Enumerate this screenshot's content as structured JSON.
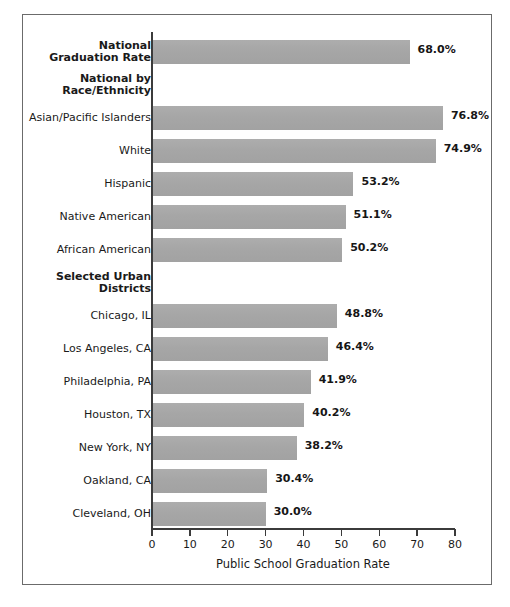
{
  "chart_data": {
    "type": "bar",
    "orientation": "horizontal",
    "title": "",
    "xlabel": "Public School Graduation Rate",
    "ylabel": "",
    "xlim": [
      0,
      80
    ],
    "xticks": [
      0,
      10,
      20,
      30,
      40,
      50,
      60,
      70,
      80
    ],
    "grid": false,
    "legend": null,
    "bar_color": "#a9a9a9",
    "categories": [
      "National\nGraduation Rate",
      "National by\nRace/Ethnicity",
      "Asian/Pacific Islanders",
      "White",
      "Hispanic",
      "Native American",
      "African American",
      "Selected Urban\nDistricts",
      "Chicago, IL",
      "Los Angeles, CA",
      "Philadelphia, PA",
      "Houston, TX",
      "New York, NY",
      "Oakland, CA",
      "Cleveland, OH"
    ],
    "values": [
      68.0,
      null,
      76.8,
      74.9,
      53.2,
      51.1,
      50.2,
      null,
      48.8,
      46.4,
      41.9,
      40.2,
      38.2,
      30.4,
      30.0
    ],
    "value_labels": [
      "68.0%",
      "",
      "76.8%",
      "74.9%",
      "53.2%",
      "51.1%",
      "50.2%",
      "",
      "48.8%",
      "46.4%",
      "41.9%",
      "40.2%",
      "38.2%",
      "30.4%",
      "30.0%"
    ],
    "rows": [
      {
        "label": "National\nGraduation Rate",
        "value": 68.0,
        "value_label": "68.0%",
        "header": true,
        "bar": true
      },
      {
        "label": "National by\nRace/Ethnicity",
        "value": null,
        "value_label": "",
        "header": true,
        "bar": false
      },
      {
        "label": "Asian/Pacific Islanders",
        "value": 76.8,
        "value_label": "76.8%",
        "header": false,
        "bar": true
      },
      {
        "label": "White",
        "value": 74.9,
        "value_label": "74.9%",
        "header": false,
        "bar": true
      },
      {
        "label": "Hispanic",
        "value": 53.2,
        "value_label": "53.2%",
        "header": false,
        "bar": true
      },
      {
        "label": "Native American",
        "value": 51.1,
        "value_label": "51.1%",
        "header": false,
        "bar": true
      },
      {
        "label": "African American",
        "value": 50.2,
        "value_label": "50.2%",
        "header": false,
        "bar": true
      },
      {
        "label": "Selected Urban\nDistricts",
        "value": null,
        "value_label": "",
        "header": true,
        "bar": false
      },
      {
        "label": "Chicago, IL",
        "value": 48.8,
        "value_label": "48.8%",
        "header": false,
        "bar": true
      },
      {
        "label": "Los Angeles, CA",
        "value": 46.4,
        "value_label": "46.4%",
        "header": false,
        "bar": true
      },
      {
        "label": "Philadelphia, PA",
        "value": 41.9,
        "value_label": "41.9%",
        "header": false,
        "bar": true
      },
      {
        "label": "Houston, TX",
        "value": 40.2,
        "value_label": "40.2%",
        "header": false,
        "bar": true
      },
      {
        "label": "New York, NY",
        "value": 38.2,
        "value_label": "38.2%",
        "header": false,
        "bar": true
      },
      {
        "label": "Oakland, CA",
        "value": 30.4,
        "value_label": "30.4%",
        "header": false,
        "bar": true
      },
      {
        "label": "Cleveland, OH",
        "value": 30.0,
        "value_label": "30.0%",
        "header": false,
        "bar": true
      }
    ]
  }
}
